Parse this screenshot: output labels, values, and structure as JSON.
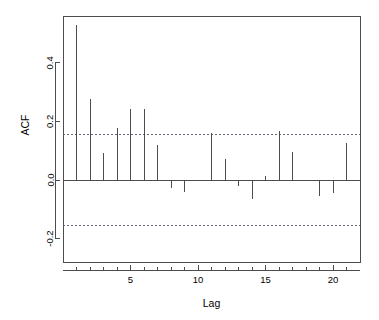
{
  "chart_data": {
    "type": "bar",
    "title": "",
    "subtitle": "",
    "xlabel": "Lag",
    "ylabel": "ACF",
    "x": [
      1,
      2,
      3,
      4,
      5,
      6,
      7,
      8,
      9,
      10,
      11,
      12,
      13,
      14,
      15,
      16,
      17,
      18,
      19,
      20,
      21
    ],
    "categories": [
      "1",
      "2",
      "3",
      "4",
      "5",
      "6",
      "7",
      "8",
      "9",
      "10",
      "11",
      "12",
      "13",
      "14",
      "15",
      "16",
      "17",
      "18",
      "19",
      "20",
      "21"
    ],
    "values": [
      0.529,
      0.278,
      0.091,
      0.178,
      0.244,
      0.241,
      0.119,
      -0.028,
      -0.042,
      -0.003,
      0.159,
      0.071,
      -0.022,
      -0.064,
      0.014,
      0.166,
      0.096,
      -0.004,
      -0.054,
      -0.046,
      0.128
    ],
    "series": [
      {
        "name": "ACF",
        "values": [
          0.529,
          0.278,
          0.091,
          0.178,
          0.244,
          0.241,
          0.119,
          -0.028,
          -0.042,
          -0.003,
          0.159,
          0.071,
          -0.022,
          -0.064,
          0.014,
          0.166,
          0.096,
          -0.004,
          -0.054,
          -0.046,
          0.128
        ]
      }
    ],
    "xlim": [
      0,
      22
    ],
    "ylim": [
      -0.28,
      0.56
    ],
    "xticks": [
      5,
      10,
      15,
      20
    ],
    "xtick_labels": [
      "5",
      "10",
      "15",
      "20"
    ],
    "yticks": [
      0.4,
      0.2,
      0.0,
      -0.2
    ],
    "ytick_labels": [
      "0.4",
      "0.2",
      "0.0",
      "-0.2"
    ],
    "grid": false,
    "legend": "none",
    "zero_line": 0.0,
    "confidence_bands": {
      "upper": 0.157,
      "lower": -0.157,
      "style": "dashed",
      "color": "#555566"
    },
    "colors": {
      "bar": "#4d4d4d",
      "axis": "#4d4d4d",
      "frame": "#4d4d4d",
      "confidence": "#666677",
      "background": "#ffffff"
    }
  },
  "figure": {
    "y_axis_title": "ACF",
    "x_axis_title": "Lag"
  }
}
